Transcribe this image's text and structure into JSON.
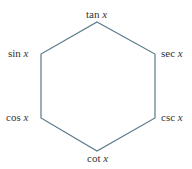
{
  "diagram": {
    "shape": "hexagon",
    "line_color": "#5a7a8a",
    "vertices": [
      {
        "id": "top",
        "label_fn": "tan",
        "label_var": "x",
        "x": 97,
        "y": 22
      },
      {
        "id": "upper-right",
        "label_fn": "sec",
        "label_var": "x",
        "x": 155,
        "y": 54
      },
      {
        "id": "lower-right",
        "label_fn": "csc",
        "label_var": "x",
        "x": 155,
        "y": 118
      },
      {
        "id": "bottom",
        "label_fn": "cot",
        "label_var": "x",
        "x": 97,
        "y": 151
      },
      {
        "id": "lower-left",
        "label_fn": "cos",
        "label_var": "x",
        "x": 41,
        "y": 118
      },
      {
        "id": "upper-left",
        "label_fn": "sin",
        "label_var": "x",
        "x": 41,
        "y": 54
      }
    ]
  }
}
